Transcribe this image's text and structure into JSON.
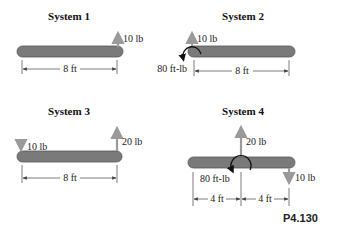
{
  "figure_label": "P4.130",
  "colors": {
    "beam": "#7a7a7a",
    "force_arrow": "#9a9a9a",
    "moment": "#111111"
  },
  "systems": [
    {
      "title": "System 1",
      "forces": [
        {
          "label": "10 lb",
          "direction": "up",
          "position": "right end"
        }
      ],
      "dimensions": [
        "8 ft"
      ]
    },
    {
      "title": "System 2",
      "forces": [
        {
          "label": "10 lb",
          "direction": "up",
          "position": "left end"
        }
      ],
      "moment": {
        "label": "80 ft-lb",
        "direction": "counterclockwise",
        "position": "left end"
      },
      "dimensions": [
        "8 ft"
      ]
    },
    {
      "title": "System 3",
      "forces": [
        {
          "label": "10 lb",
          "direction": "down",
          "position": "left end"
        },
        {
          "label": "20 lb",
          "direction": "up",
          "position": "right end"
        }
      ],
      "dimensions": [
        "8 ft"
      ]
    },
    {
      "title": "System 4",
      "forces": [
        {
          "label": "20 lb",
          "direction": "up",
          "position": "center"
        },
        {
          "label": "10 lb",
          "direction": "down",
          "position": "right end"
        }
      ],
      "moment": {
        "label": "80 ft-lb",
        "direction": "clockwise",
        "position": "center"
      },
      "dimensions": [
        "4 ft",
        "4 ft"
      ]
    }
  ]
}
